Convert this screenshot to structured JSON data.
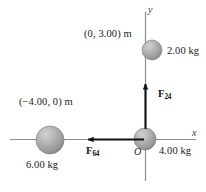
{
  "figure": {
    "background_color": "#ffffff",
    "width": 206,
    "height": 192
  },
  "axes": {
    "x_label": "x",
    "y_label": "y",
    "origin_label": "O",
    "axis_color": "#8a8a8a"
  },
  "particles": [
    {
      "id": "particle-4kg",
      "mass_label": "4.00 kg",
      "coord_label": "",
      "position_px": {
        "x": 145,
        "y": 139
      },
      "radius_px": 11,
      "color": "#9c9c9c"
    },
    {
      "id": "particle-2kg",
      "mass_label": "2.00 kg",
      "coord_label": "(0, 3.00) m",
      "position_px": {
        "x": 152,
        "y": 50
      },
      "radius_px": 10,
      "color": "#9c9c9c"
    },
    {
      "id": "particle-6kg",
      "mass_label": "6.00 kg",
      "coord_label": "(−4.00, 0) m",
      "position_px": {
        "x": 50,
        "y": 140
      },
      "radius_px": 14,
      "color": "#9c9c9c"
    }
  ],
  "forces": [
    {
      "id": "force-24",
      "symbol": "F",
      "subscript": "24",
      "direction": "up",
      "color": "#111111"
    },
    {
      "id": "force-64",
      "symbol": "F",
      "subscript": "64",
      "direction": "left",
      "color": "#111111"
    }
  ]
}
